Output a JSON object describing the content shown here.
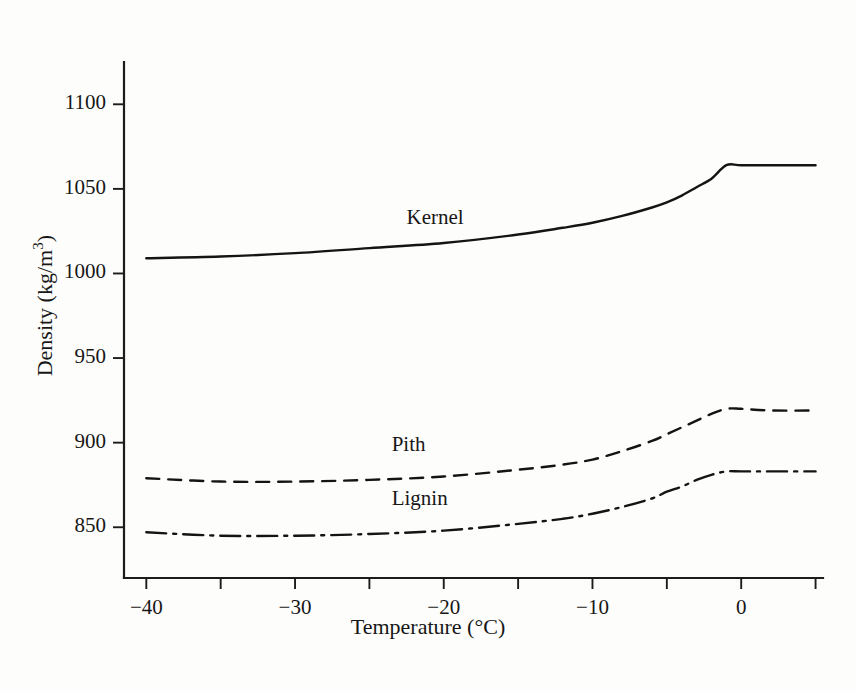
{
  "chart_data": {
    "type": "line",
    "title": "",
    "xlabel": "Temperature (°C)",
    "ylabel": "Density (kg/m3)",
    "ylabel_base": "Density (kg/m",
    "ylabel_exponent": "3",
    "ylabel_tail": ")",
    "xlim": [
      -41.5,
      5.5
    ],
    "ylim": [
      820,
      1125
    ],
    "grid": false,
    "legend": "inline-labels",
    "xticks": [
      -40,
      -35,
      -30,
      -25,
      -20,
      -15,
      -10,
      -5,
      0,
      5
    ],
    "xtick_labels": [
      "−40",
      "",
      "−30",
      "",
      "−20",
      "",
      "−10",
      "",
      "0",
      ""
    ],
    "yticks": [
      850,
      900,
      950,
      1000,
      1050,
      1100
    ],
    "ytick_labels": [
      "850",
      "900",
      "950",
      "1000",
      "1050",
      "1100"
    ],
    "series": [
      {
        "name": "Kernel",
        "style": "solid",
        "label_x": -22.5,
        "label_y": 1032,
        "x": [
          -40,
          -35,
          -30,
          -25,
          -20,
          -15,
          -12,
          -10,
          -8,
          -6,
          -5,
          -4,
          -3,
          -2,
          -1,
          0,
          2,
          5
        ],
        "y": [
          1009,
          1010,
          1012,
          1015,
          1018,
          1023,
          1027,
          1030,
          1034,
          1039,
          1042,
          1046,
          1051,
          1056,
          1064,
          1064,
          1064,
          1064
        ]
      },
      {
        "name": "Pith",
        "style": "dashed",
        "label_x": -23.5,
        "label_y": 898,
        "x": [
          -40,
          -35,
          -30,
          -25,
          -20,
          -15,
          -12,
          -10,
          -8,
          -6,
          -5,
          -4,
          -3,
          -2,
          -1,
          0,
          2,
          5
        ],
        "y": [
          879,
          877,
          877,
          878,
          880,
          884,
          887,
          890,
          895,
          901,
          905,
          909,
          913,
          917,
          920,
          920,
          919,
          919
        ]
      },
      {
        "name": "Lignin",
        "style": "dashdot",
        "label_x": -23.5,
        "label_y": 866,
        "x": [
          -40,
          -35,
          -30,
          -25,
          -20,
          -15,
          -12,
          -10,
          -8,
          -6,
          -5,
          -4,
          -3,
          -2,
          -1,
          0,
          2,
          5
        ],
        "y": [
          847,
          845,
          845,
          846,
          848,
          852,
          855,
          858,
          862,
          867,
          871,
          874,
          878,
          881,
          883,
          883,
          883,
          883
        ]
      }
    ]
  },
  "colors": {
    "line": "#141414",
    "axis": "#1c1c1c",
    "background": "#fdfdfb"
  }
}
